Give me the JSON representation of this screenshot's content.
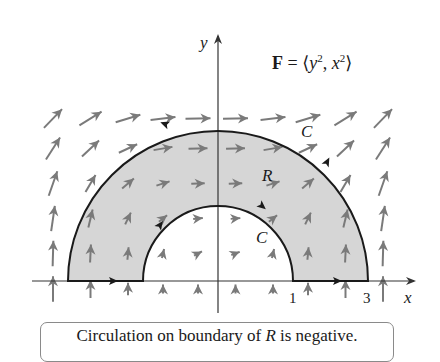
{
  "figure": {
    "formula": {
      "bold_symbol": "F",
      "equals": " = ⟨",
      "y_var": "y",
      "y_exp": "2",
      "sep": ", ",
      "x_var": "x",
      "x_exp": "2",
      "close": "⟩"
    },
    "axes": {
      "x_label": "x",
      "y_label": "y",
      "x_ticks": [
        {
          "label": "1",
          "value": 1
        },
        {
          "label": "3",
          "value": 3
        }
      ]
    },
    "region": {
      "label": "R",
      "inner_radius": 1,
      "outer_radius": 3,
      "fill_color": "#d9d9d9"
    },
    "curve_labels": {
      "outer": "C",
      "inner": "C"
    },
    "colors": {
      "boundary": "#1a1a1a",
      "vectors": "#7a7a7a",
      "axis": "#333333"
    }
  },
  "caption": {
    "prefix": "Circulation on boundary of ",
    "italic": "R",
    "suffix": " is negative."
  }
}
